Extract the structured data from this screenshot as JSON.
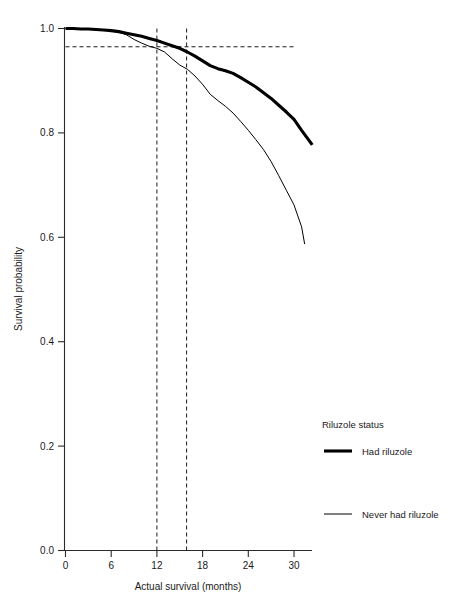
{
  "chart_data": {
    "type": "line",
    "title": "",
    "xlabel": "Actual survival (months)",
    "ylabel": "Survival probability",
    "xlim": [
      0,
      32.5
    ],
    "ylim": [
      0.0,
      1.0
    ],
    "xticks": [
      0,
      6,
      12,
      18,
      24,
      30
    ],
    "xtick_labels": [
      "0",
      "6",
      "12",
      "18",
      "24",
      "30"
    ],
    "yticks": [
      0.0,
      0.2,
      0.4,
      0.6,
      0.8,
      1.0
    ],
    "ytick_labels": [
      "0.0",
      "0.2",
      "0.4",
      "0.6",
      "0.8",
      "1.0"
    ],
    "grid": false,
    "legend_position": "right",
    "legend_title": "Riluzole status",
    "series": [
      {
        "name": "Had riluzole",
        "style": "thick",
        "x": [
          0,
          1,
          2,
          3,
          4,
          5,
          6,
          7,
          8,
          9,
          10,
          11,
          12,
          13,
          14,
          15,
          16,
          17,
          18,
          19,
          20,
          21,
          22,
          23,
          24,
          25,
          26,
          27,
          28,
          29,
          30,
          31,
          32.4
        ],
        "y": [
          1.0,
          1.0,
          0.999,
          0.999,
          0.998,
          0.997,
          0.996,
          0.994,
          0.991,
          0.988,
          0.985,
          0.981,
          0.977,
          0.972,
          0.967,
          0.962,
          0.955,
          0.947,
          0.938,
          0.929,
          0.923,
          0.919,
          0.914,
          0.906,
          0.897,
          0.888,
          0.877,
          0.866,
          0.853,
          0.84,
          0.826,
          0.805,
          0.777
        ]
      },
      {
        "name": "Never had riluzole",
        "style": "thin",
        "x": [
          0,
          1,
          2,
          3,
          4,
          5,
          6,
          7,
          8,
          9,
          10,
          11,
          12,
          13,
          14,
          15,
          16,
          17,
          18,
          19,
          20,
          21,
          22,
          23,
          24,
          25,
          26,
          27,
          28,
          29,
          30,
          31,
          31.4
        ],
        "y": [
          1.0,
          1.0,
          0.999,
          0.999,
          0.998,
          0.997,
          0.996,
          0.993,
          0.988,
          0.979,
          0.972,
          0.966,
          0.962,
          0.955,
          0.942,
          0.93,
          0.922,
          0.909,
          0.893,
          0.874,
          0.862,
          0.851,
          0.838,
          0.822,
          0.805,
          0.787,
          0.768,
          0.745,
          0.718,
          0.69,
          0.662,
          0.62,
          0.587
        ]
      }
    ],
    "annotations": [
      {
        "type": "hline",
        "label": "reference survival probability",
        "y": 0.965,
        "x_start": 0,
        "x_end": 30,
        "style": "dashed"
      },
      {
        "type": "vline",
        "label": "12 months",
        "x": 12,
        "y_start": 0.0,
        "y_end": 1.0,
        "style": "dashed"
      },
      {
        "type": "vline",
        "label": "16 months",
        "x": 15.9,
        "y_start": 0.0,
        "y_end": 1.0,
        "style": "dashed"
      }
    ]
  },
  "legend": {
    "title": "Riluzole status",
    "entries": [
      {
        "label": "Had riluzole"
      },
      {
        "label": "Never had riluzole"
      }
    ]
  },
  "axes": {
    "x_title": "Actual survival (months)",
    "y_title": "Survival probability",
    "x_tick_0": "0",
    "x_tick_1": "6",
    "x_tick_2": "12",
    "x_tick_3": "18",
    "x_tick_4": "24",
    "x_tick_5": "30",
    "y_tick_0": "0.0",
    "y_tick_1": "0.2",
    "y_tick_2": "0.4",
    "y_tick_3": "0.6",
    "y_tick_4": "0.8",
    "y_tick_5": "1.0"
  },
  "colors": {
    "line": "#000000",
    "axis": "#2b2b2b",
    "background": "#ffffff",
    "text": "#1a1a1a"
  }
}
